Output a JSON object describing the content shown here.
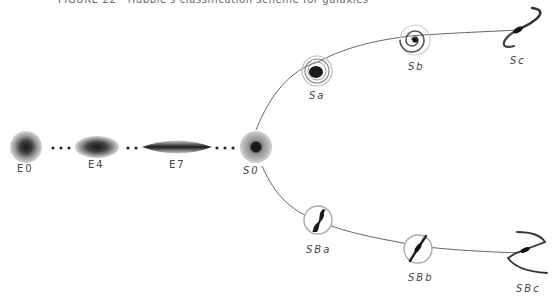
{
  "title": "FIGURE 22 · Hubble's classification scheme for galaxies",
  "diagram": {
    "type": "tuning-fork",
    "ellipticals": [
      {
        "id": "E0",
        "label": "E0"
      },
      {
        "id": "E4",
        "label": "E4"
      },
      {
        "id": "E7",
        "label": "E7"
      }
    ],
    "lenticular": {
      "id": "S0",
      "label": "S0"
    },
    "normal_spirals": [
      {
        "id": "Sa",
        "label": "Sa"
      },
      {
        "id": "Sb",
        "label": "Sb"
      },
      {
        "id": "Sc",
        "label": "Sc"
      }
    ],
    "barred_spirals": [
      {
        "id": "SBa",
        "label": "SBa"
      },
      {
        "id": "SBb",
        "label": "SBb"
      },
      {
        "id": "SBc",
        "label": "SBc"
      }
    ],
    "colors": {
      "line": "#555555",
      "galaxy_core": "#1a1a1a",
      "galaxy_halo": "#bdbdbd",
      "text": "#444444"
    }
  }
}
